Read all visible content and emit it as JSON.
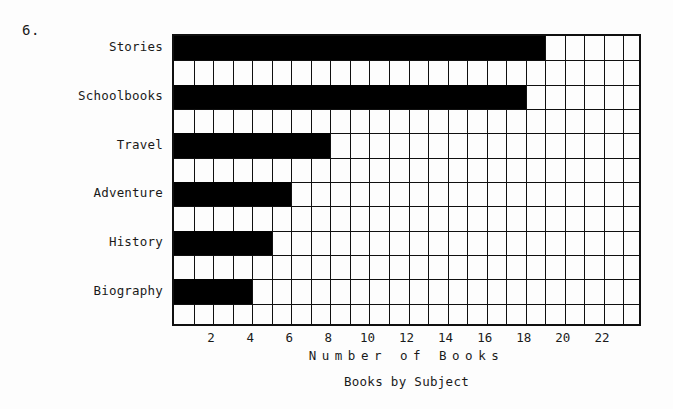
{
  "question_number": "6.",
  "chart_data": {
    "type": "bar",
    "orientation": "horizontal",
    "title": "",
    "caption": "Books by Subject",
    "xlabel": "Number of Books",
    "ylabel": "",
    "categories": [
      "Stories",
      "Schoolbooks",
      "Travel",
      "Adventure",
      "History",
      "Biography"
    ],
    "values": [
      19,
      18,
      8,
      6,
      5,
      4
    ],
    "xlim": [
      0,
      24
    ],
    "x_tick_labels": [
      "2",
      "4",
      "6",
      "8",
      "10",
      "12",
      "14",
      "16",
      "18",
      "20",
      "22"
    ],
    "x_tick_values": [
      2,
      4,
      6,
      8,
      10,
      12,
      14,
      16,
      18,
      20,
      22
    ],
    "x_minor_step": 1,
    "grid": true,
    "legend": "none",
    "bar_color": "#000000",
    "frame_color": "#101010",
    "background_color": "#fdfdfd"
  }
}
